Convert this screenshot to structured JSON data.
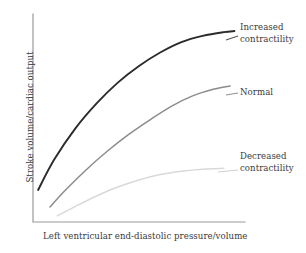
{
  "chart_data": {
    "type": "line",
    "title": "",
    "subtitle": "",
    "xlabel": "Left ventricular end-diastolic pressure/volume",
    "ylabel": "Stroke volume/cardiac output",
    "grid": false,
    "legend_position": "inline-right-annotations",
    "axis_ticks": "none",
    "xlim": [
      0,
      100
    ],
    "ylim": [
      0,
      100
    ],
    "axis_color": "#9a9a9a",
    "series": [
      {
        "name": "Increased contractility",
        "color": "#2b2b2b",
        "width": 1.9,
        "label_lines": [
          "Increased",
          "contractility"
        ],
        "x": [
          2.4,
          10,
          20,
          30,
          40,
          50,
          60,
          70,
          80,
          90,
          95
        ],
        "y": [
          15.4,
          30,
          45,
          57,
          67,
          75,
          81.5,
          86.5,
          89.5,
          91.3,
          91.8
        ]
      },
      {
        "name": "Normal",
        "color": "#8c8c8c",
        "width": 1.5,
        "label_lines": [
          "Normal"
        ],
        "x": [
          8,
          15,
          25,
          35,
          45,
          55,
          65,
          75,
          85,
          93
        ],
        "y": [
          7.2,
          15,
          25,
          34,
          42,
          49,
          55.5,
          60.5,
          63.8,
          65.4
        ],
        "label_name": "Normal"
      },
      {
        "name": "Decreased contractility",
        "color": "#d9d9d9",
        "width": 1.5,
        "label_lines": [
          "Decreased",
          "contractility"
        ],
        "x": [
          11.5,
          20,
          30,
          40,
          50,
          60,
          70,
          80,
          90
        ],
        "y": [
          3.0,
          7.5,
          12.5,
          16.8,
          20.2,
          22.8,
          24.4,
          25.4,
          25.8
        ]
      }
    ]
  },
  "labels": {
    "increased_line1": "Increased",
    "increased_line2": "contractility",
    "normal_line1": "Normal",
    "decreased_line1": "Decreased",
    "decreased_line2": "contractility",
    "x_axis": "Left ventricular end-diastolic pressure/volume",
    "y_axis": "Stroke volume/cardiac output"
  }
}
